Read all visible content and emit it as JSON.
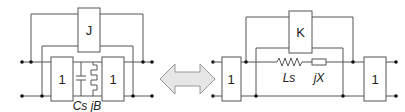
{
  "left_circuit": {
    "top_block": "J",
    "left_block": "1",
    "right_block": "1",
    "caption": "Cs jB",
    "components": [
      "capacitor",
      "inductor"
    ]
  },
  "arrow": {
    "type": "double-headed",
    "fill": "#e6e6e6"
  },
  "right_circuit": {
    "top_block": "K",
    "left_block": "1",
    "right_block": "1",
    "inductor_label": "Ls",
    "reactance_label": "jX"
  },
  "colors": {
    "wire": "#555555",
    "dot": "#111111",
    "arrow_fill": "#e6e6e6",
    "arrow_stroke": "#999999"
  }
}
